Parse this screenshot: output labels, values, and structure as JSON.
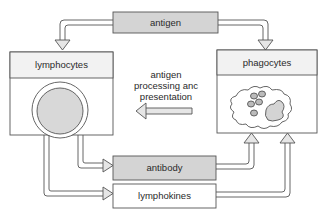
{
  "diagram": {
    "nodes": {
      "antigen": {
        "label": "antigen",
        "fill": "#d4d4d4"
      },
      "lymphocytes": {
        "label": "lymphocytes",
        "fill": "#f2f2f2"
      },
      "phagocytes": {
        "label": "phagocytes",
        "fill": "#f2f2f2"
      },
      "antibody": {
        "label": "antibody",
        "fill": "#d4d4d4"
      },
      "lymphokines": {
        "label": "lymphokines",
        "fill": "#ffffff"
      }
    },
    "center_note": {
      "line1": "antigen",
      "line2": "processing anc",
      "line3": "presentation"
    },
    "edges": [
      {
        "from": "antigen",
        "to": "lymphocytes"
      },
      {
        "from": "antigen",
        "to": "phagocytes"
      },
      {
        "from": "phagocytes",
        "to": "lymphocytes",
        "label": "antigen processing and presentation"
      },
      {
        "from": "lymphocytes",
        "to": "antibody"
      },
      {
        "from": "lymphocytes",
        "to": "lymphokines"
      },
      {
        "from": "antibody",
        "to": "phagocytes"
      },
      {
        "from": "lymphokines",
        "to": "phagocytes"
      }
    ],
    "colors": {
      "stroke": "#555555",
      "shade": "#d4d4d4",
      "header": "#f2f2f2"
    }
  }
}
